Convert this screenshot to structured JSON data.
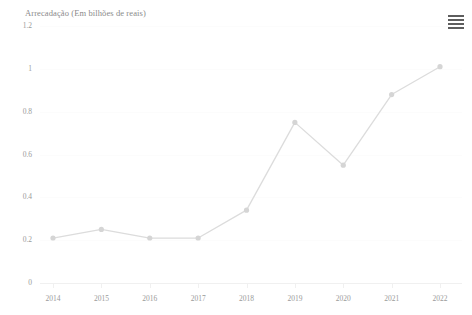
{
  "header": {
    "title": "Arrecadação (Em bilhões de reais)",
    "ghost_subtitle": "",
    "menu_icon": "hamburger-menu-icon"
  },
  "colors": {
    "line": "#dcdcdc",
    "marker": "#d5d5d5",
    "grid": "#fcfcfc",
    "axis": "#f0f0f0",
    "label_text": "#9a9a9a",
    "title_text": "#8a8a8a",
    "background": "#ffffff"
  },
  "chart_data": {
    "type": "line",
    "title": "Arrecadação (Em bilhões de reais)",
    "subtitle": "",
    "xlabel": "",
    "ylabel": "Arrecadação (Em bilhões de reais)",
    "categories": [
      "2014",
      "2015",
      "2016",
      "2017",
      "2018",
      "2019",
      "2020",
      "2021",
      "2022"
    ],
    "x": [
      2014,
      2015,
      2016,
      2017,
      2018,
      2019,
      2020,
      2021,
      2022
    ],
    "values": [
      0.21,
      0.25,
      0.21,
      0.21,
      0.34,
      0.75,
      0.55,
      0.88,
      1.01
    ],
    "series": [
      {
        "name": "Arrecadação",
        "values": [
          0.21,
          0.25,
          0.21,
          0.21,
          0.34,
          0.75,
          0.55,
          0.88,
          1.01
        ]
      }
    ],
    "ylim": [
      0,
      1.2
    ],
    "yticks": [
      0,
      0.2,
      0.4,
      0.6,
      0.8,
      1,
      1.2
    ],
    "ytick_labels": [
      "0",
      "0.2",
      "0.4",
      "0.6",
      "0.8",
      "1",
      "1.2"
    ],
    "grid": true,
    "grid_axis": "y",
    "legend": false,
    "legend_position": "none",
    "markers": true,
    "annotations": []
  }
}
